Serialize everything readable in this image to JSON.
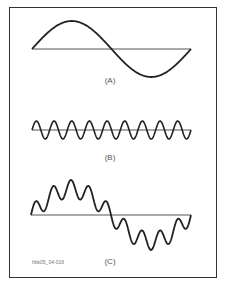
{
  "figure": {
    "id_label": "hbk05_04-018",
    "panels": [
      {
        "key": "A",
        "label": "(A)",
        "description": "Fundamental sine wave, one cycle"
      },
      {
        "key": "B",
        "label": "(B)",
        "description": "Higher-frequency sine wave, approx. 9 cycles"
      },
      {
        "key": "C",
        "label": "(C)",
        "description": "Sum of A and B: fundamental with superimposed ripple"
      }
    ]
  },
  "colors": {
    "stroke": "#222222",
    "axis": "#555555",
    "frame": "#333333"
  }
}
